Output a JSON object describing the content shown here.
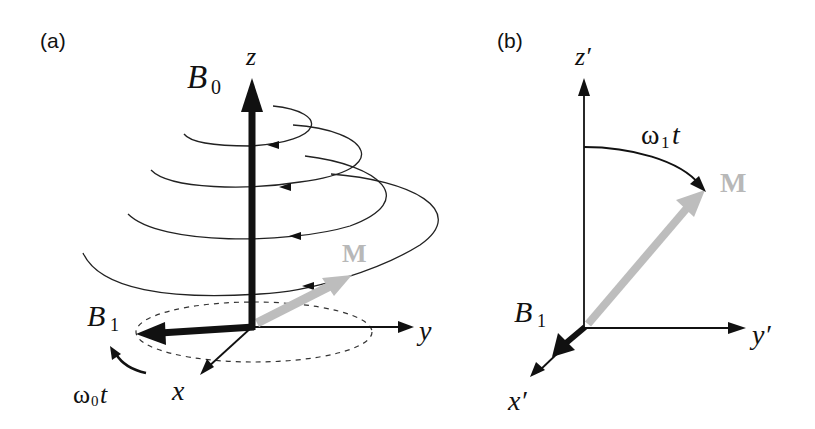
{
  "figure": {
    "panels": [
      {
        "id": "a",
        "label": "(a)",
        "axes": {
          "z": "z",
          "y": "y",
          "x": "x"
        },
        "vectors": {
          "b0": {
            "symbol": "B",
            "subscript": "0"
          },
          "b1": {
            "symbol": "B",
            "subscript": "1"
          },
          "m": {
            "symbol": "M"
          }
        },
        "rotation": {
          "omega": "ω",
          "subscript": "0",
          "suffix": "t"
        }
      },
      {
        "id": "b",
        "label": "(b)",
        "axes": {
          "z": "z′",
          "y": "y′",
          "x": "x′"
        },
        "vectors": {
          "b1": {
            "symbol": "B",
            "subscript": "1"
          },
          "m": {
            "symbol": "M"
          }
        },
        "rotation": {
          "omega": "ω",
          "subscript": "1",
          "suffix": "t"
        }
      }
    ],
    "colors": {
      "ink": "#111111",
      "magnetization": "#bdbdbd"
    }
  }
}
